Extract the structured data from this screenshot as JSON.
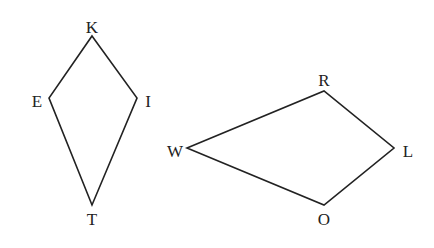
{
  "figures": [
    {
      "name": "kite-KITE",
      "vertices": [
        {
          "label": "K",
          "x": 92,
          "y": 36,
          "lx": 92,
          "ly": 33
        },
        {
          "label": "I",
          "x": 137,
          "y": 98,
          "lx": 148,
          "ly": 107
        },
        {
          "label": "T",
          "x": 92,
          "y": 205,
          "lx": 92,
          "ly": 225
        },
        {
          "label": "E",
          "x": 49,
          "y": 98,
          "lx": 37,
          "ly": 107
        }
      ]
    },
    {
      "name": "kite-WROL",
      "vertices": [
        {
          "label": "W",
          "x": 187,
          "y": 148,
          "lx": 175,
          "ly": 157
        },
        {
          "label": "R",
          "x": 324,
          "y": 91,
          "lx": 324,
          "ly": 86
        },
        {
          "label": "L",
          "x": 394,
          "y": 148,
          "lx": 408,
          "ly": 157
        },
        {
          "label": "O",
          "x": 324,
          "y": 205,
          "lx": 324,
          "ly": 225
        }
      ]
    }
  ],
  "colors": {
    "stroke": "#222222",
    "background": "#ffffff"
  }
}
